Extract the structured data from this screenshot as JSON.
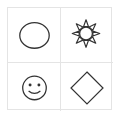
{
  "grid": {
    "rows": 2,
    "columns": 2,
    "border_color": "#e4e4e4",
    "stroke_color": "#333333",
    "cells": [
      {
        "shape": "circle",
        "icon": "circle-icon"
      },
      {
        "shape": "sun",
        "icon": "sun-icon"
      },
      {
        "shape": "smiley-face",
        "icon": "smiley-icon"
      },
      {
        "shape": "diamond",
        "icon": "diamond-icon"
      }
    ]
  }
}
